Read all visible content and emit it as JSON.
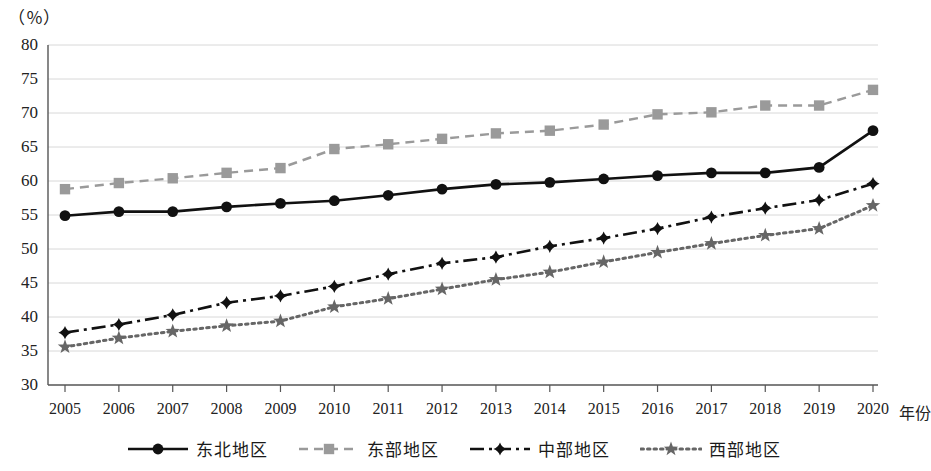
{
  "chart_data": {
    "type": "line",
    "title": "",
    "subtitle": "",
    "unit_label": "（％）",
    "xlabel": "年份",
    "ylabel": "",
    "ylim": [
      30,
      80
    ],
    "ytick_step": 5,
    "yticks": [
      30,
      35,
      40,
      45,
      50,
      55,
      60,
      65,
      70,
      75,
      80
    ],
    "grid": true,
    "legend_position": "bottom",
    "categories": [
      "2005",
      "2006",
      "2007",
      "2008",
      "2009",
      "2010",
      "2011",
      "2012",
      "2013",
      "2014",
      "2015",
      "2016",
      "2017",
      "2018",
      "2019",
      "2020"
    ],
    "series": [
      {
        "name": "东北地区",
        "marker": "circle",
        "line_style": "solid",
        "color": "#111111",
        "values": [
          54.9,
          55.5,
          55.5,
          56.2,
          56.7,
          57.1,
          57.9,
          58.8,
          59.5,
          59.8,
          60.3,
          60.8,
          61.2,
          61.2,
          62.0,
          67.4
        ]
      },
      {
        "name": "东部地区",
        "marker": "square",
        "line_style": "dashed",
        "color": "#9a9a9a",
        "values": [
          58.8,
          59.7,
          60.4,
          61.2,
          61.9,
          64.7,
          65.4,
          66.2,
          67.0,
          67.4,
          68.3,
          69.8,
          70.1,
          71.1,
          71.1,
          73.4
        ]
      },
      {
        "name": "中部地区",
        "marker": "diamond",
        "line_style": "dashdot",
        "color": "#111111",
        "values": [
          37.7,
          38.9,
          40.3,
          42.1,
          43.1,
          44.5,
          46.3,
          47.9,
          48.8,
          50.4,
          51.6,
          53.0,
          54.7,
          56.0,
          57.2,
          59.6
        ]
      },
      {
        "name": "西部地区",
        "marker": "star",
        "line_style": "dotted",
        "color": "#666666",
        "values": [
          35.6,
          36.9,
          37.9,
          38.7,
          39.4,
          41.5,
          42.7,
          44.1,
          45.5,
          46.6,
          48.1,
          49.5,
          50.8,
          52.0,
          53.0,
          56.4
        ]
      }
    ]
  },
  "axes": {
    "y_tick_labels": [
      "80",
      "75",
      "70",
      "65",
      "60",
      "55",
      "50",
      "45",
      "40",
      "35",
      "30"
    ],
    "x_tick_labels": [
      "2005",
      "2006",
      "2007",
      "2008",
      "2009",
      "2010",
      "2011",
      "2012",
      "2013",
      "2014",
      "2015",
      "2016",
      "2017",
      "2018",
      "2019",
      "2020"
    ],
    "x_axis_title": "年份"
  },
  "legend": {
    "items": [
      {
        "label": "东北地区",
        "marker": "circle-marker",
        "color": "#111111",
        "line": "solid"
      },
      {
        "label": "东部地区",
        "marker": "square-marker",
        "color": "#9a9a9a",
        "line": "dashed"
      },
      {
        "label": "中部地区",
        "marker": "diamond-marker",
        "color": "#111111",
        "line": "dashdot"
      },
      {
        "label": "西部地区",
        "marker": "star-marker",
        "color": "#666666",
        "line": "dotted"
      }
    ]
  },
  "colors": {
    "grid": "#d8d8d8",
    "axis": "#555555",
    "background": "#ffffff"
  }
}
